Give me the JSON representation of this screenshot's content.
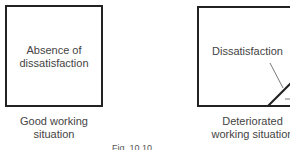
{
  "panels": [
    {
      "box_label": "Absence of dissatisfaction",
      "caption": "Good working situation"
    },
    {
      "box_label": "Dissatisfaction",
      "caption": "Deteriorated working situation"
    }
  ],
  "figure_caption": "Fig. 10.10"
}
